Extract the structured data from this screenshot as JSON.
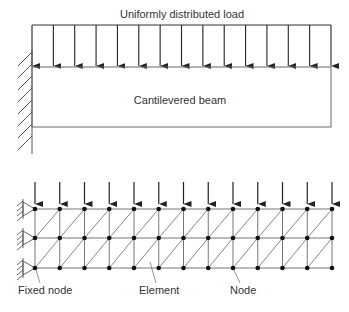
{
  "top_diagram": {
    "title": "Uniformly distributed load",
    "beam_label": "Cantilevered beam",
    "load_arrow_count": 15,
    "support": "fixed-wall"
  },
  "bottom_diagram": {
    "labels": {
      "fixed_node": "Fixed node",
      "element": "Element",
      "node": "Node"
    },
    "mesh": {
      "node_columns": 13,
      "node_rows": 3,
      "element_type": "triangular",
      "diagonal_direction": "bottom-left-to-top-right",
      "load_arrow_count": 13,
      "fixed_nodes_per_row": 1
    }
  },
  "colors": {
    "line": "#333333",
    "mesh_line": "#777777",
    "node": "#111111",
    "text": "#333333"
  }
}
